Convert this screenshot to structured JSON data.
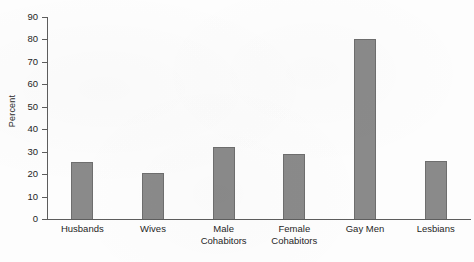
{
  "chart_data": {
    "type": "bar",
    "title": "",
    "subtitle": "",
    "xlabel": "",
    "ylabel": "Percent",
    "ylim": [
      0,
      90
    ],
    "yticks": [
      0,
      10,
      20,
      30,
      40,
      50,
      60,
      70,
      80,
      90
    ],
    "grid": false,
    "legend": false,
    "legend_position": "none",
    "categories": [
      "Husbands",
      "Wives",
      "Male\nCohabitors",
      "Female\nCohabitors",
      "Gay Men",
      "Lesbians"
    ],
    "values": [
      25.5,
      20.5,
      32,
      29,
      80,
      26
    ],
    "bar_color": "#8a8a8a",
    "bar_edge_color": "#6e6e6e",
    "axis_color": "#5d5d5d",
    "background_color": "#fdfdfd"
  }
}
